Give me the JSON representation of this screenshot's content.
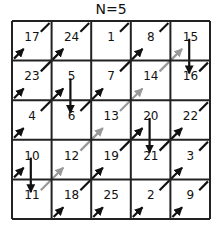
{
  "title": "N=5",
  "grid": {
    "size": 5,
    "origin_x": 12,
    "origin_y": 21,
    "cell": 39.6,
    "values": [
      [
        17,
        24,
        1,
        8,
        15
      ],
      [
        23,
        5,
        7,
        14,
        16
      ],
      [
        4,
        6,
        13,
        20,
        22
      ],
      [
        10,
        12,
        19,
        21,
        3
      ],
      [
        11,
        18,
        25,
        2,
        9
      ]
    ],
    "positions": [
      [
        "17",
        "24",
        "1",
        "8",
        "15"
      ],
      [
        "23",
        "5",
        "7",
        "14",
        "16"
      ],
      [
        "4",
        "6",
        "13",
        "20",
        "22"
      ],
      [
        "10",
        "12",
        "19",
        "21",
        "3"
      ],
      [
        "11",
        "18",
        "25",
        "2",
        "9"
      ]
    ]
  },
  "colors": {
    "grid": "#222222",
    "arrow_black": "#111111",
    "arrow_gray": "#999999"
  },
  "moves": [
    {
      "from": 1,
      "to": 2,
      "type": "diag-wrap",
      "color": "black"
    },
    {
      "from": 2,
      "to": 3,
      "type": "diag",
      "color": "black"
    },
    {
      "from": 3,
      "to": 4,
      "type": "diag-wrap",
      "color": "black"
    },
    {
      "from": 4,
      "to": 5,
      "type": "diag",
      "color": "black"
    },
    {
      "from": 5,
      "to": 6,
      "type": "down",
      "color": "black"
    },
    {
      "from": 6,
      "to": 7,
      "type": "diag",
      "color": "black"
    },
    {
      "from": 7,
      "to": 8,
      "type": "diag",
      "color": "black"
    },
    {
      "from": 8,
      "to": 9,
      "type": "diag-wrap",
      "color": "black"
    },
    {
      "from": 9,
      "to": 10,
      "type": "diag-wrap",
      "color": "black"
    },
    {
      "from": 10,
      "to": 11,
      "type": "down",
      "color": "black"
    },
    {
      "from": 11,
      "to": 12,
      "type": "diag",
      "color": "gray"
    },
    {
      "from": 12,
      "to": 13,
      "type": "diag",
      "color": "gray"
    },
    {
      "from": 13,
      "to": 14,
      "type": "diag",
      "color": "gray"
    },
    {
      "from": 14,
      "to": 15,
      "type": "diag",
      "color": "gray"
    },
    {
      "from": 15,
      "to": 16,
      "type": "down",
      "color": "black"
    },
    {
      "from": 16,
      "to": 17,
      "type": "diag-wrap",
      "color": "black"
    },
    {
      "from": 17,
      "to": 18,
      "type": "diag-wrap",
      "color": "black"
    },
    {
      "from": 18,
      "to": 19,
      "type": "diag",
      "color": "black"
    },
    {
      "from": 19,
      "to": 20,
      "type": "diag",
      "color": "black"
    },
    {
      "from": 20,
      "to": 21,
      "type": "down",
      "color": "black"
    },
    {
      "from": 21,
      "to": 22,
      "type": "diag",
      "color": "black"
    },
    {
      "from": 22,
      "to": 23,
      "type": "diag-wrap",
      "color": "black"
    },
    {
      "from": 23,
      "to": 24,
      "type": "diag",
      "color": "black"
    },
    {
      "from": 24,
      "to": 25,
      "type": "diag-wrap",
      "color": "black"
    }
  ]
}
